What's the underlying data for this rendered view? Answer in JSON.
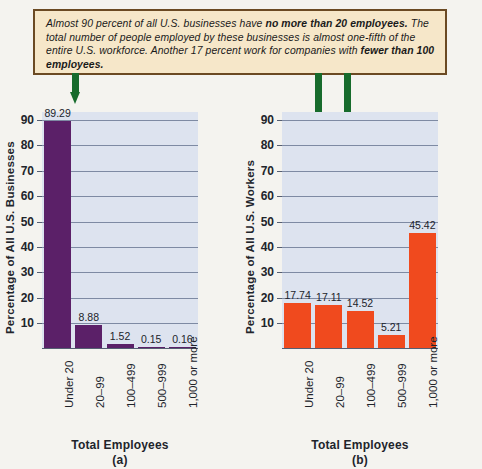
{
  "callout": {
    "segments": [
      {
        "text": "Almost 90 percent of all U.S. businesses have ",
        "bold": false
      },
      {
        "text": "no more than 20 employees.",
        "bold": true
      },
      {
        "text": " The total number of people employed by these businesses is almost one-fifth of the entire U.S. workforce. Another 17 percent work for companies with ",
        "bold": false
      },
      {
        "text": "fewer than 100 employees.",
        "bold": true
      }
    ],
    "background": "#f6e7c9",
    "border_color": "#6b4a23"
  },
  "annotations": {
    "arrow_color": "#176b2c",
    "arrows": [
      {
        "name": "arrow-to-under-20-businesses",
        "target": "Under 20 bar in chart (a)"
      },
      {
        "name": "arrow-to-under-20-workers",
        "target": "Under 20 bar in chart (b)"
      },
      {
        "name": "arrow-to-20-99-workers",
        "target": "20-99 bar in chart (b)"
      }
    ]
  },
  "chart_data": [
    {
      "type": "bar",
      "panel": "(a)",
      "title": "",
      "categories": [
        "Under 20",
        "20–99",
        "100–499",
        "500–999",
        "1,000 or more"
      ],
      "values": [
        89.29,
        8.88,
        1.52,
        0.15,
        0.16
      ],
      "value_labels": [
        "89.29",
        "8.88",
        "1.52",
        "0.15",
        "0.16"
      ],
      "xlabel": "Total Employees",
      "ylabel": "Percentage of All U.S. Businesses",
      "ylim": [
        0,
        95
      ],
      "yticks": [
        10,
        20,
        30,
        40,
        50,
        60,
        70,
        80,
        90
      ],
      "bar_color": "#5b2068",
      "grid": true,
      "legend": "none"
    },
    {
      "type": "bar",
      "panel": "(b)",
      "title": "",
      "categories": [
        "Under 20",
        "20–99",
        "100–499",
        "500–999",
        "1,000 or more"
      ],
      "values": [
        17.74,
        17.11,
        14.52,
        5.21,
        45.42
      ],
      "value_labels": [
        "17.74",
        "17.11",
        "14.52",
        "5.21",
        "45.42"
      ],
      "xlabel": "Total Employees",
      "ylabel": "Percentage of All U.S. Workers",
      "ylim": [
        0,
        95
      ],
      "yticks": [
        10,
        20,
        30,
        40,
        50,
        60,
        70,
        80,
        90
      ],
      "bar_color": "#f04a1e",
      "grid": true,
      "legend": "none"
    }
  ]
}
